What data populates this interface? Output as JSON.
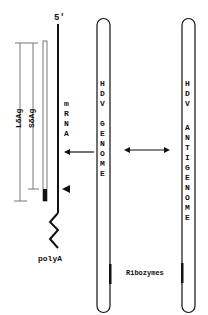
{
  "diagram": {
    "five_prime_label": "5'",
    "mrna_letters": [
      "m",
      "R",
      "N",
      "A"
    ],
    "polya_label": "polyA",
    "large_antigen_label": "LδAg",
    "small_antigen_label": "SδAg",
    "genome_letters": [
      "H",
      "D",
      "V",
      "",
      "G",
      "E",
      "N",
      "O",
      "M",
      "E"
    ],
    "antigenome_letters": [
      "H",
      "D",
      "V",
      "",
      "A",
      "N",
      "T",
      "I",
      "G",
      "E",
      "N",
      "O",
      "M",
      "E"
    ],
    "ribozymes_label": "Ribozymes",
    "colors": {
      "line": "#111111",
      "background": "#ffffff",
      "bar": "#777777"
    }
  }
}
